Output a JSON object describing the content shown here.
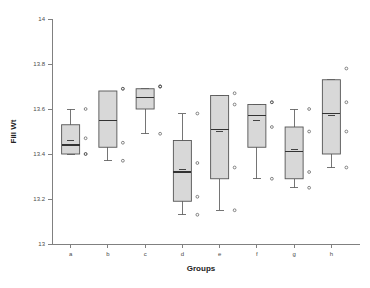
{
  "chart_data": {
    "type": "box",
    "title": "",
    "xlabel": "Groups",
    "ylabel": "Fill Wt",
    "ylim": [
      13,
      14
    ],
    "yticks": [
      13,
      13.2,
      13.4,
      13.6,
      13.8,
      14
    ],
    "ytick_labels": [
      "13",
      "13.2",
      "13.4",
      "13.6",
      "13.8",
      "14"
    ],
    "categories": [
      "a",
      "b",
      "c",
      "d",
      "e",
      "f",
      "g",
      "h"
    ],
    "grid": false,
    "legend": null,
    "boxes": [
      {
        "category": "a",
        "whisker_low": 13.4,
        "q1": 13.4,
        "median": 13.44,
        "q3": 13.53,
        "whisker_high": 13.6,
        "mean": 13.46,
        "points": [
          13.6,
          13.47,
          13.4,
          13.4
        ]
      },
      {
        "category": "b",
        "whisker_low": 13.37,
        "q1": 13.43,
        "median": 13.55,
        "q3": 13.68,
        "whisker_high": 13.68,
        "mean": 13.55,
        "points": [
          13.69,
          13.69,
          13.45,
          13.37
        ]
      },
      {
        "category": "c",
        "whisker_low": 13.49,
        "q1": 13.6,
        "median": 13.65,
        "q3": 13.69,
        "whisker_high": 13.69,
        "mean": 13.65,
        "points": [
          13.7,
          13.7,
          13.7,
          13.49
        ]
      },
      {
        "category": "d",
        "whisker_low": 13.13,
        "q1": 13.19,
        "median": 13.32,
        "q3": 13.46,
        "whisker_high": 13.58,
        "mean": 13.33,
        "points": [
          13.58,
          13.36,
          13.21,
          13.13
        ]
      },
      {
        "category": "e",
        "whisker_low": 13.15,
        "q1": 13.29,
        "median": 13.51,
        "q3": 13.66,
        "whisker_high": 13.66,
        "mean": 13.5,
        "points": [
          13.67,
          13.62,
          13.34,
          13.15
        ]
      },
      {
        "category": "f",
        "whisker_low": 13.29,
        "q1": 13.43,
        "median": 13.57,
        "q3": 13.62,
        "whisker_high": 13.62,
        "mean": 13.55,
        "points": [
          13.63,
          13.63,
          13.52,
          13.29
        ]
      },
      {
        "category": "g",
        "whisker_low": 13.25,
        "q1": 13.29,
        "median": 13.41,
        "q3": 13.52,
        "whisker_high": 13.6,
        "mean": 13.42,
        "points": [
          13.6,
          13.5,
          13.32,
          13.25
        ]
      },
      {
        "category": "h",
        "whisker_low": 13.34,
        "q1": 13.4,
        "median": 13.58,
        "q3": 13.73,
        "whisker_high": 13.73,
        "mean": 13.57,
        "points": [
          13.78,
          13.63,
          13.5,
          13.34
        ]
      }
    ],
    "colors": {
      "box_fill": "#d8d8d8",
      "box_stroke": "#555555",
      "axis": "#808080",
      "text": "#222222"
    }
  }
}
